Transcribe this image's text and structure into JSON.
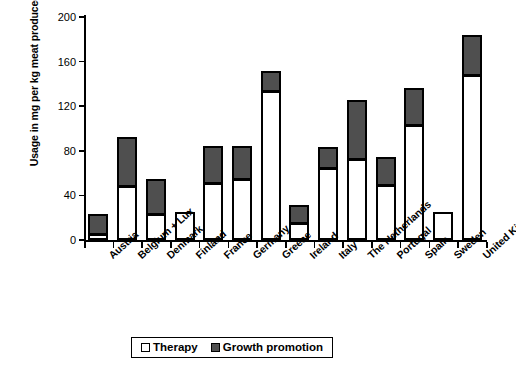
{
  "chart_data": {
    "type": "bar",
    "subtype": "stacked-vertical",
    "title": "",
    "xlabel": "",
    "ylabel": "Usage in mg per kg meat produced",
    "ylim": [
      0,
      200
    ],
    "yticks": [
      0,
      40,
      80,
      120,
      160,
      200
    ],
    "grid": false,
    "legend_position": "bottom",
    "categories": [
      "Austria",
      "Belgium + Lux",
      "Denmark",
      "Finland",
      "France",
      "Germany",
      "Greece",
      "Ireland",
      "Italy",
      "The Netherlands",
      "Portugal",
      "Spain",
      "Sweden",
      "United Kingdom"
    ],
    "series": [
      {
        "name": "Therapy",
        "color": "#ffffff",
        "values": [
          5,
          48,
          23,
          25,
          51,
          55,
          134,
          15,
          65,
          73,
          49,
          103,
          25,
          148
        ]
      },
      {
        "name": "Growth promotion",
        "color": "#4f4f4f",
        "values": [
          18,
          44,
          32,
          0,
          33,
          29,
          18,
          16,
          18,
          53,
          25,
          33,
          0,
          36
        ]
      }
    ],
    "totals": [
      23,
      92,
      55,
      25,
      84,
      84,
      152,
      31,
      83,
      126,
      74,
      136,
      25,
      184
    ]
  },
  "axis": {
    "y_tick_labels": [
      "200",
      "160",
      "120",
      "80",
      "40",
      "0"
    ]
  },
  "legend": {
    "items": [
      {
        "label": "Therapy",
        "swatch": "white-square-icon"
      },
      {
        "label": "Growth promotion",
        "swatch": "dark-square-icon"
      }
    ]
  }
}
